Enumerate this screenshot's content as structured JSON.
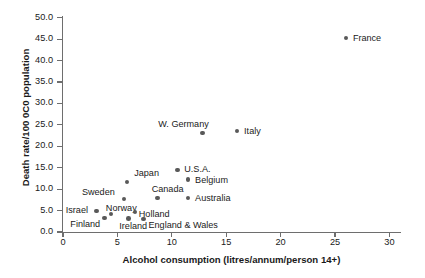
{
  "chart_data": {
    "type": "scatter",
    "title": "",
    "xlabel": "Alcohol consumption (litres/annum/person 14+)",
    "ylabel": "Death rate/100 0C0 population",
    "xlim": [
      0,
      31
    ],
    "ylim": [
      0.0,
      50.0
    ],
    "grid": false,
    "legend": "none",
    "marker_color": "#595959",
    "axis_color": "#6e6e6e",
    "xticks": [
      "0",
      "5",
      "10",
      "15",
      "20",
      "25",
      "30"
    ],
    "xtick_values": [
      0,
      5,
      10,
      15,
      20,
      25,
      30
    ],
    "yticks": [
      "0.0",
      "5.0",
      "10.0",
      "15.0",
      "20.0",
      "25.0",
      "30.0",
      "35.0",
      "40.0",
      "45.0",
      "50.0"
    ],
    "ytick_values": [
      0.0,
      5.0,
      10.0,
      15.0,
      20.0,
      25.0,
      30.0,
      35.0,
      40.0,
      45.0,
      50.0
    ],
    "points": [
      {
        "label": "France",
        "x": 26.0,
        "y": 45.3,
        "label_dx": 7,
        "label_dy": -4
      },
      {
        "label": "Italy",
        "x": 16.0,
        "y": 23.6,
        "label_dx": 7,
        "label_dy": -4
      },
      {
        "label": "W. Germany",
        "x": 12.8,
        "y": 23.1,
        "label_dx": -44,
        "label_dy": -13
      },
      {
        "label": "U.S.A.",
        "x": 10.5,
        "y": 14.5,
        "label_dx": 7,
        "label_dy": -5
      },
      {
        "label": "Belgium",
        "x": 11.5,
        "y": 12.2,
        "label_dx": 7,
        "label_dy": -4
      },
      {
        "label": "Japan",
        "x": 5.9,
        "y": 11.7,
        "label_dx": 7,
        "label_dy": -13
      },
      {
        "label": "Canada",
        "x": 8.7,
        "y": 7.9,
        "label_dx": -6,
        "label_dy": -13
      },
      {
        "label": "Australia",
        "x": 11.5,
        "y": 7.9,
        "label_dx": 7,
        "label_dy": -4
      },
      {
        "label": "Sweden",
        "x": 5.6,
        "y": 7.7,
        "label_dx": -42,
        "label_dy": -11
      },
      {
        "label": "Israel",
        "x": 3.1,
        "y": 4.9,
        "label_dx": -31,
        "label_dy": -5
      },
      {
        "label": "Norway",
        "x": 4.4,
        "y": 4.2,
        "label_dx": -5,
        "label_dy": -10
      },
      {
        "label": "Holland",
        "x": 6.6,
        "y": 4.7,
        "label_dx": 4,
        "label_dy": -2
      },
      {
        "label": "Finland",
        "x": 3.8,
        "y": 3.3,
        "label_dx": -34,
        "label_dy": 2
      },
      {
        "label": "Ireland",
        "x": 6.0,
        "y": 3.1,
        "label_dx": -9,
        "label_dy": 3
      },
      {
        "label": "England & Wales",
        "x": 7.4,
        "y": 3.0,
        "label_dx": 5,
        "label_dy": 2
      }
    ]
  }
}
